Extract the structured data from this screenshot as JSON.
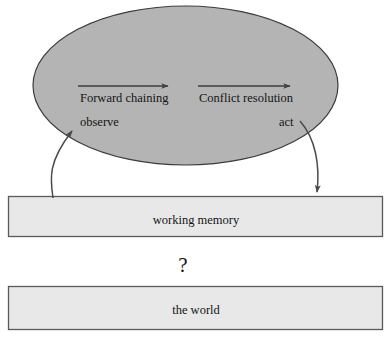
{
  "diagram": {
    "colors": {
      "ellipse_fill": "#b4b4b4",
      "ellipse_stroke": "#3c3c3c",
      "box_fill": "#e8e8e8",
      "box_stroke": "#5a5a5a",
      "arrow_stroke": "#3f3f3f",
      "text": "#141414",
      "background": "#ffffff"
    },
    "ellipse": {
      "name": "production-system-ellipse",
      "labels": {
        "forward_chaining": "Forward chaining",
        "conflict_resolution": "Conflict resolution",
        "observe": "observe",
        "act": "act"
      },
      "arrows": [
        {
          "name": "forward-chaining-arrow",
          "direction": "right"
        },
        {
          "name": "conflict-resolution-arrow",
          "direction": "right"
        }
      ]
    },
    "boxes": [
      {
        "name": "working-memory-box",
        "label": "working memory"
      },
      {
        "name": "the-world-box",
        "label": "the world"
      }
    ],
    "connectors": [
      {
        "name": "observe-curved-arrow",
        "from": "working memory",
        "to": "observe",
        "direction": "up"
      },
      {
        "name": "act-curved-arrow",
        "from": "act",
        "to": "working memory",
        "direction": "down"
      }
    ],
    "annotations": {
      "question_mark": "?"
    }
  }
}
